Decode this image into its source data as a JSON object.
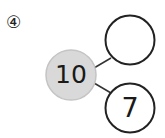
{
  "problem": {
    "number_label": "④"
  },
  "number_bond": {
    "whole": {
      "value": "10",
      "fill": "#d9d9d9",
      "stroke": "#bdbdbd"
    },
    "parts": [
      {
        "value": "",
        "stroke": "#222222"
      },
      {
        "value": "7",
        "stroke": "#222222"
      }
    ]
  }
}
